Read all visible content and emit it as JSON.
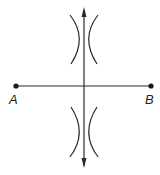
{
  "diagram": {
    "type": "perpendicular-bisector-construction",
    "points": [
      {
        "id": "A",
        "label": "A"
      },
      {
        "id": "B",
        "label": "B"
      }
    ],
    "segment": {
      "from": "A",
      "to": "B"
    },
    "bisector": {
      "arrows": "both-ends"
    },
    "arcs": {
      "upper_intersection": true,
      "lower_intersection": true
    },
    "colors": {
      "ink": "#2a2a2a",
      "background": "#ffffff"
    }
  }
}
